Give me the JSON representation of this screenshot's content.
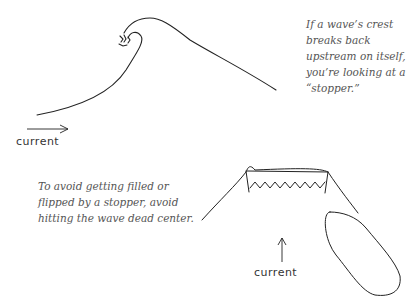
{
  "captions": {
    "stopper_definition": "If a wave’s crest breaks back upstream on itself, you’re look­ing at a “stopper.”",
    "avoid_center": "To avoid getting filled or flipped by a stopper, avoid hitting the wave dead center."
  },
  "labels": {
    "current_top": "current",
    "current_bottom": "current"
  },
  "figures": [
    {
      "name": "breaking-wave-side-view",
      "arrow": "right"
    },
    {
      "name": "stopper-front-view-with-boat",
      "arrow": "up"
    }
  ],
  "colors": {
    "line": "#222222",
    "caption": "#555555"
  }
}
